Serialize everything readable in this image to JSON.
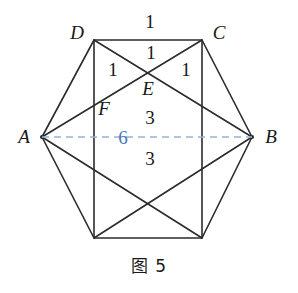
{
  "figure": {
    "caption": "图 5",
    "stroke_color": "#2b2b2b",
    "accent_color": "#4477bb",
    "dash_color": "#8fb6dd",
    "background_color": "#ffffff",
    "vertices": [
      {
        "id": "A",
        "label": "A",
        "x": 42,
        "y": 137,
        "label_x": 24,
        "label_y": 136
      },
      {
        "id": "D",
        "label": "D",
        "x": 94,
        "y": 40,
        "label_x": 77,
        "label_y": 32
      },
      {
        "id": "C",
        "label": "C",
        "x": 202,
        "y": 40,
        "label_x": 219,
        "label_y": 32
      },
      {
        "id": "B",
        "label": "B",
        "x": 252,
        "y": 137,
        "label_x": 271,
        "label_y": 136
      },
      {
        "id": "G",
        "label": "",
        "x": 202,
        "y": 238,
        "label_x": 0,
        "label_y": 0
      },
      {
        "id": "H",
        "label": "",
        "x": 94,
        "y": 238,
        "label_x": 0,
        "label_y": 0
      }
    ],
    "interior_points": [
      {
        "id": "E",
        "label": "E",
        "x": 148,
        "y": 75,
        "label_x": 148,
        "label_y": 88
      },
      {
        "id": "F",
        "label": "F",
        "x": 94,
        "y": 97,
        "label_x": 104,
        "label_y": 108
      }
    ],
    "measure_labels": [
      {
        "id": "dc-top",
        "text": "1",
        "x": 150,
        "y": 21,
        "color": "#171717"
      },
      {
        "id": "de-top",
        "text": "1",
        "x": 151,
        "y": 52,
        "color": "#171717"
      },
      {
        "id": "de-left",
        "text": "1",
        "x": 113,
        "y": 69,
        "color": "#171717"
      },
      {
        "id": "ce-right",
        "text": "1",
        "x": 186,
        "y": 69,
        "color": "#171717"
      },
      {
        "id": "upper-3",
        "text": "3",
        "x": 150,
        "y": 117,
        "color": "#171717"
      },
      {
        "id": "ab-6",
        "text": "6",
        "x": 123,
        "y": 137,
        "color": "#4477bb"
      },
      {
        "id": "lower-3",
        "text": "3",
        "x": 150,
        "y": 158,
        "color": "#171717"
      }
    ],
    "dashed_segment": {
      "from": "A",
      "to": "B",
      "x1": 42,
      "y1": 137,
      "x2": 252,
      "y2": 137
    }
  }
}
